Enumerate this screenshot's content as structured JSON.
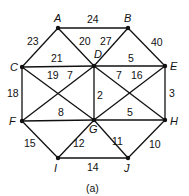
{
  "caption": "(a)",
  "nodes": [
    {
      "id": "A"
    },
    {
      "id": "B"
    },
    {
      "id": "C"
    },
    {
      "id": "D"
    },
    {
      "id": "E"
    },
    {
      "id": "F"
    },
    {
      "id": "G"
    },
    {
      "id": "H"
    },
    {
      "id": "I"
    },
    {
      "id": "J"
    }
  ],
  "edges": [
    {
      "from": "A",
      "to": "B",
      "weight": "24"
    },
    {
      "from": "A",
      "to": "C",
      "weight": "23"
    },
    {
      "from": "A",
      "to": "D",
      "weight": "20"
    },
    {
      "from": "B",
      "to": "D",
      "weight": "27"
    },
    {
      "from": "B",
      "to": "E",
      "weight": "40"
    },
    {
      "from": "C",
      "to": "D",
      "weight": "21"
    },
    {
      "from": "C",
      "to": "F",
      "weight": "18"
    },
    {
      "from": "C",
      "to": "G",
      "weight": "19"
    },
    {
      "from": "F",
      "to": "D",
      "weight": "7"
    },
    {
      "from": "D",
      "to": "G",
      "weight": "2"
    },
    {
      "from": "D",
      "to": "H",
      "weight": "7"
    },
    {
      "from": "G",
      "to": "E",
      "weight": "16"
    },
    {
      "from": "D",
      "to": "E",
      "weight": "5"
    },
    {
      "from": "E",
      "to": "H",
      "weight": "3"
    },
    {
      "from": "F",
      "to": "G",
      "weight": "8"
    },
    {
      "from": "G",
      "to": "H",
      "weight": "5"
    },
    {
      "from": "F",
      "to": "I",
      "weight": "15"
    },
    {
      "from": "G",
      "to": "I",
      "weight": "12"
    },
    {
      "from": "G",
      "to": "J",
      "weight": "11"
    },
    {
      "from": "H",
      "to": "J",
      "weight": "10"
    },
    {
      "from": "I",
      "to": "J",
      "weight": "14"
    }
  ]
}
